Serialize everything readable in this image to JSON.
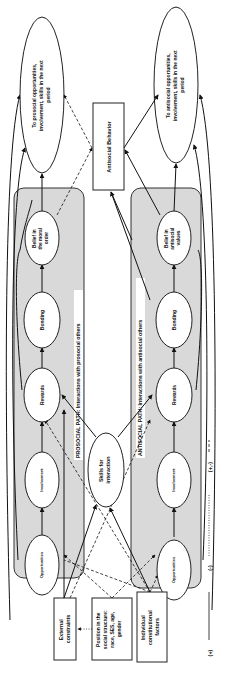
{
  "diagram": {
    "orientation": "rotated-90-ccw",
    "prosocial_path": {
      "label": "PROSOCIAL PATH: Interactions with prosocial others",
      "nodes": {
        "opportunities": "Opportunities",
        "involvement": "Involvement",
        "rewards": "Rewards",
        "bonding": "Bonding",
        "belief": [
          "Belief in",
          "the moral",
          "order"
        ]
      },
      "outcome": [
        "To  prosocial opportunities,",
        "involvement, skills in the next",
        "period"
      ]
    },
    "antisocial_path": {
      "label": "ANTISOCIAL PATH: Interactions with antisocial others",
      "nodes": {
        "opportunities": "Opportunities",
        "involvement": "Involvement",
        "rewards": "Rewards",
        "bonding": "Bonding",
        "belief": [
          "Belief in",
          "antisocial",
          "values"
        ]
      },
      "outcome": [
        "To antisocial opportunities,",
        "involvement, skills in the next",
        "period"
      ]
    },
    "center": {
      "antisocial_behavior": "Antisocial Behavior",
      "skills": [
        "Skills for",
        "interaction"
      ]
    },
    "exogenous": {
      "external_constraints": [
        "External",
        "constraints"
      ],
      "position_in_social_structure": [
        "Position in the",
        "social structure:",
        "race, SES, age,",
        "gender"
      ],
      "individual_constitutional_factors": [
        "Individual",
        "constitutional",
        "factors"
      ]
    },
    "legend": [
      {
        "symbol": "(+)",
        "line": "solid"
      },
      {
        "symbol": "(-)",
        "line": "dotted"
      },
      {
        "symbol": "(+,-)",
        "line": "dashed"
      }
    ]
  }
}
